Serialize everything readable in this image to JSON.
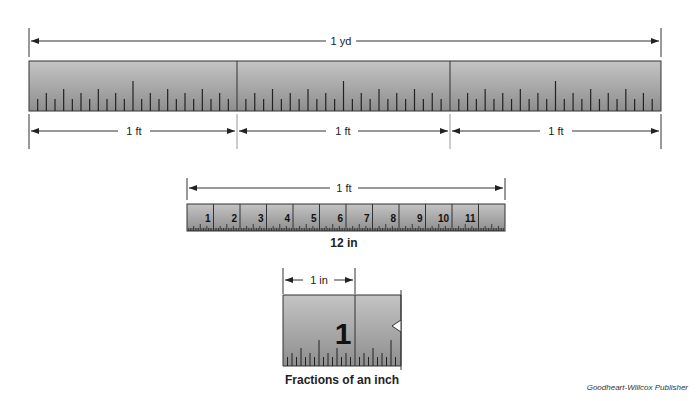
{
  "diagram": {
    "yard_ruler": {
      "label": "1 yd",
      "segments": [
        "1 ft",
        "1 ft",
        "1 ft"
      ]
    },
    "foot_ruler": {
      "label": "1 ft",
      "numbers": [
        "1",
        "2",
        "3",
        "4",
        "5",
        "6",
        "7",
        "8",
        "9",
        "10",
        "11"
      ],
      "caption": "12 in"
    },
    "inch_ruler": {
      "label": "1 in",
      "number": "1",
      "caption": "Fractions of an inch"
    },
    "credit": "Goodheart-Willcox Publisher"
  }
}
